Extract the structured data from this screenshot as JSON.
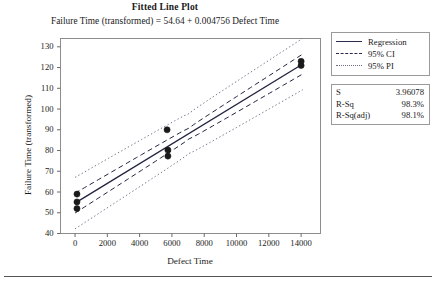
{
  "chart_data": {
    "type": "scatter",
    "title": "Fitted Line Plot",
    "subtitle": "Failure Time (transformed) = 54.64 + 0.004756 Defect Time",
    "xlabel": "Defect Time",
    "ylabel": "Failure Time (transformed)",
    "xlim": [
      -900,
      15200
    ],
    "ylim": [
      40,
      134
    ],
    "xticks": [
      0,
      2000,
      4000,
      6000,
      8000,
      10000,
      12000,
      14000
    ],
    "xticklabels": [
      "0",
      "2000",
      "4000",
      "6000",
      "8000",
      "10000",
      "12000",
      "14000"
    ],
    "yticks": [
      40,
      50,
      60,
      70,
      80,
      90,
      100,
      110,
      120,
      130
    ],
    "yticklabels": [
      "40",
      "50",
      "60",
      "70",
      "80",
      "90",
      "100",
      "110",
      "120",
      "130"
    ],
    "grid": false,
    "legend_position": "right",
    "fit": {
      "intercept": 54.64,
      "slope": 0.004756,
      "x_start": 0,
      "x_end": 14100
    },
    "points": [
      {
        "x": 120,
        "y": 59.0
      },
      {
        "x": 120,
        "y": 55.2
      },
      {
        "x": 120,
        "y": 52.0
      },
      {
        "x": 5700,
        "y": 90.0
      },
      {
        "x": 5750,
        "y": 80.2
      },
      {
        "x": 5750,
        "y": 77.3
      },
      {
        "x": 14000,
        "y": 123.0
      },
      {
        "x": 14000,
        "y": 121.0
      }
    ],
    "bands": {
      "ci_label": "95% CI",
      "pi_label": "95% PI",
      "ci_half_width_center": 2.6,
      "ci_half_width_edge": 4.8,
      "pi_half_width_center": 9.6,
      "pi_half_width_edge": 12.4
    },
    "series_colors": {
      "regression": "#23233f",
      "ci": "#23233f",
      "pi": "#75758f",
      "marker": "#1a1a1a"
    },
    "legend": [
      {
        "label": "Regression",
        "style": "solid"
      },
      {
        "label": "95% CI",
        "style": "dashed"
      },
      {
        "label": "95% PI",
        "style": "dotted"
      }
    ],
    "stats": [
      {
        "key": "S",
        "value": "3.96078"
      },
      {
        "key": "R-Sq",
        "value": "98.3%"
      },
      {
        "key": "R-Sq(adj)",
        "value": "98.1%"
      }
    ]
  }
}
